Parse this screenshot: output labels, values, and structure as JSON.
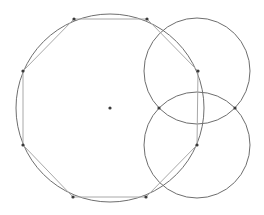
{
  "diagram": {
    "type": "geometric-construction",
    "colors": {
      "background": "#ffffff",
      "circle_stroke": "#6e6e6e",
      "polygon_stroke": "#a8a8a8",
      "point_fill": "#3a3a3a"
    },
    "main_circle": {
      "cx": 110,
      "cy": 108,
      "r": 94
    },
    "center_point": {
      "x": 110,
      "y": 108
    },
    "octagon_vertices": [
      {
        "x": 74,
        "y": 19
      },
      {
        "x": 147,
        "y": 19
      },
      {
        "x": 198,
        "y": 71
      },
      {
        "x": 197,
        "y": 145
      },
      {
        "x": 146,
        "y": 197
      },
      {
        "x": 73,
        "y": 197
      },
      {
        "x": 23,
        "y": 145
      },
      {
        "x": 23,
        "y": 71
      }
    ],
    "auxiliary_circles": [
      {
        "cx": 197,
        "cy": 71,
        "r": 53
      },
      {
        "cx": 197,
        "cy": 145,
        "r": 53
      }
    ],
    "intersection_points": [
      {
        "x": 159,
        "y": 108
      },
      {
        "x": 235,
        "y": 108
      }
    ]
  }
}
